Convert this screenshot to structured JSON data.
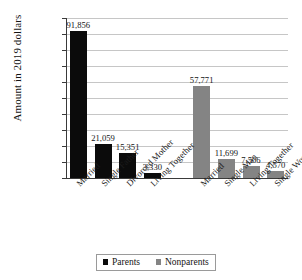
{
  "chart_data": {
    "type": "bar",
    "title": "",
    "xlabel": "",
    "ylabel": "Amount in 2019 dollars",
    "ylim": [
      0,
      100000
    ],
    "grid": true,
    "legend_position": "bottom",
    "categories": [
      "Married",
      "Single Father",
      "Divorced Mother",
      "Living Together",
      "Married",
      "Single Man",
      "Living Together",
      "Single Women"
    ],
    "series": [
      {
        "name": "Parents",
        "color": "#0b0b0b",
        "values": [
          91856,
          21059,
          15351,
          3330,
          null,
          null,
          null,
          null
        ]
      },
      {
        "name": "Nonparents",
        "color": "#848484",
        "values": [
          null,
          null,
          null,
          null,
          57771,
          11699,
          7506,
          4570
        ]
      }
    ],
    "bars": [
      {
        "category": "Married",
        "group": "Parents",
        "value": 91856,
        "label": "91,856"
      },
      {
        "category": "Single Father",
        "group": "Parents",
        "value": 21059,
        "label": "21,059"
      },
      {
        "category": "Divorced Mother",
        "group": "Parents",
        "value": 15351,
        "label": "15,351"
      },
      {
        "category": "Living Together",
        "group": "Parents",
        "value": 3330,
        "label": "3,330"
      },
      {
        "category": "Married",
        "group": "Nonparents",
        "value": 57771,
        "label": "57,771"
      },
      {
        "category": "Single Man",
        "group": "Nonparents",
        "value": 11699,
        "label": "11,699"
      },
      {
        "category": "Living Together",
        "group": "Nonparents",
        "value": 7506,
        "label": "7,506"
      },
      {
        "category": "Single Women",
        "group": "Nonparents",
        "value": 4570,
        "label": "4,570"
      }
    ],
    "y_ticks": [
      "100,000",
      "90,000",
      "80,000",
      "70,000",
      "60,000",
      "50,000",
      "40,000",
      "30,000",
      "20,000",
      "10,000",
      "0"
    ],
    "y_tick_values": [
      100000,
      90000,
      80000,
      70000,
      60000,
      50000,
      40000,
      30000,
      20000,
      10000,
      0
    ],
    "legend": [
      {
        "label": "Parents",
        "color": "#0b0b0b"
      },
      {
        "label": "Nonparents",
        "color": "#848484"
      }
    ]
  }
}
